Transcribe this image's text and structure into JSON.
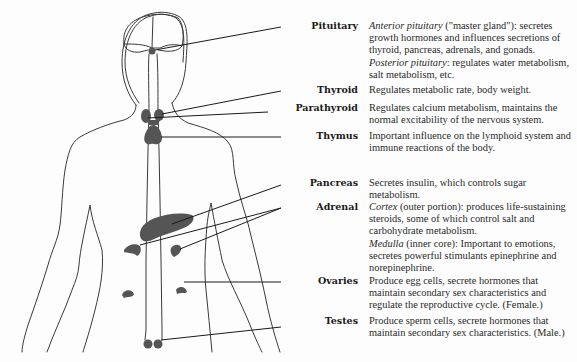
{
  "figure": {
    "gland_color": "#555555"
  },
  "glands": [
    {
      "name": "Pituitary",
      "paragraphs": [
        {
          "italic": "Anterior pituitary",
          "text": " (\"master gland\"): secretes growth hormones and influences secretions of thyroid, pancreas, adrenals, and gonads."
        },
        {
          "italic": "Posterior pituitary",
          "text": ": regulates water metabolism, salt metabolism, etc."
        }
      ]
    },
    {
      "name": "Thyroid",
      "paragraphs": [
        {
          "italic": "",
          "text": "Regulates metabolic rate, body weight."
        }
      ]
    },
    {
      "name": "Parathyroid",
      "paragraphs": [
        {
          "italic": "",
          "text": "Regulates calcium metabolism, maintains the normal excitability of the nervous system."
        }
      ]
    },
    {
      "name": "Thymus",
      "paragraphs": [
        {
          "italic": "",
          "text": "Important influence on the lymphoid system and immune reactions of the body."
        }
      ]
    },
    {
      "name": "Pancreas",
      "paragraphs": [
        {
          "italic": "",
          "text": "Secretes insulin, which controls sugar metabolism."
        }
      ]
    },
    {
      "name": "Adrenal",
      "paragraphs": [
        {
          "italic": "Cortex",
          "text": " (outer portion): produces life-sustaining steroids, some of which control salt and carbohydrate metabolism."
        },
        {
          "italic": "Medulla",
          "text": " (inner core): Important to emotions, secretes powerful stimulants epinephrine and norepinephrine."
        }
      ]
    },
    {
      "name": "Ovaries",
      "paragraphs": [
        {
          "italic": "",
          "text": "Produce egg cells, secrete hormones that maintain secondary sex characteristics and regulate the reproductive cycle. (Female.)"
        }
      ]
    },
    {
      "name": "Testes",
      "paragraphs": [
        {
          "italic": "",
          "text": "Produce sperm cells, secrete hormones that maintain secondary sex characteristics. (Male.)"
        }
      ]
    }
  ]
}
